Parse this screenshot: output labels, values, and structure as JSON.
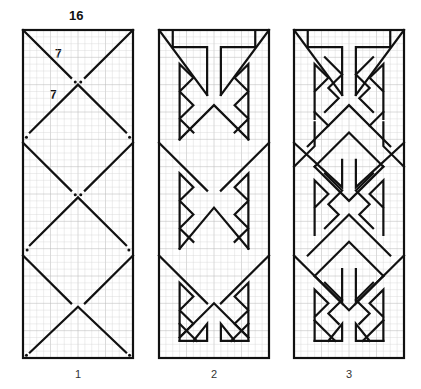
{
  "figure": {
    "panels": [
      {
        "id": 1,
        "caption": "1"
      },
      {
        "id": 2,
        "caption": "2"
      },
      {
        "id": 3,
        "caption": "3"
      }
    ],
    "dimensions": {
      "width_label": "16",
      "segment_label_upper": "7",
      "segment_label_lower": "7"
    },
    "grid": {
      "columns": 16,
      "rows": 48,
      "line_color": "#d6d6d6",
      "stroke_color": "#111111"
    }
  }
}
